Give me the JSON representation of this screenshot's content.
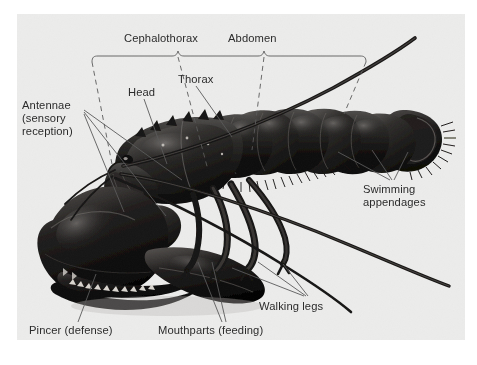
{
  "figure": {
    "panel_background": "#ececeb",
    "page_background": "#ffffff",
    "ink_color": "#2b2b2b",
    "leader_color": "#5a5a5a"
  },
  "labels": {
    "cephalothorax": "Cephalothorax",
    "abdomen": "Abdomen",
    "thorax": "Thorax",
    "head": "Head",
    "antennae_line1": "Antennae",
    "antennae_line2": "(sensory",
    "antennae_line3": "reception)",
    "swimming_line1": "Swimming",
    "swimming_line2": "appendages",
    "walking_legs": "Walking legs",
    "mouthparts": "Mouthparts (feeding)",
    "pincer": "Pincer (defense)"
  },
  "label_positions": {
    "cephalothorax": {
      "x": 124,
      "y": 39
    },
    "abdomen": {
      "x": 228,
      "y": 39
    },
    "thorax": {
      "x": 178,
      "y": 80
    },
    "head": {
      "x": 128,
      "y": 93
    },
    "antennae": {
      "x": 22,
      "y": 100
    },
    "swimming": {
      "x": 363,
      "y": 184
    },
    "walking_legs": {
      "x": 259,
      "y": 301
    },
    "mouthparts": {
      "x": 158,
      "y": 326
    },
    "pincer": {
      "x": 29,
      "y": 326
    }
  }
}
